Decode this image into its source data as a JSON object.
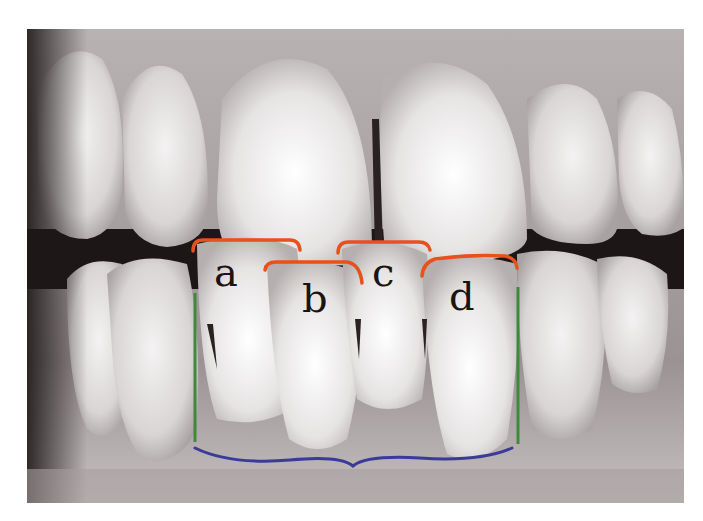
{
  "figure": {
    "labels": [
      {
        "id": "a",
        "text": "a"
      },
      {
        "id": "b",
        "text": "b"
      },
      {
        "id": "c",
        "text": "c"
      },
      {
        "id": "d",
        "text": "d"
      }
    ],
    "annotation_colors": {
      "incisal_brackets": "#e8501e",
      "vertical_lines": "#3f8a3a",
      "bottom_brace": "#3a3a9a"
    }
  }
}
